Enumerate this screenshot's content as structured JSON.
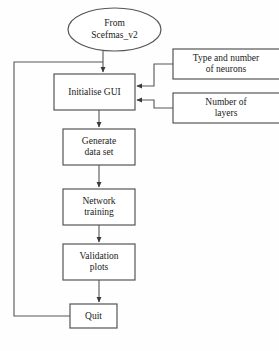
{
  "diagram": {
    "type": "flowchart",
    "background_color": "#fefefe",
    "stroke_color": "#555555",
    "text_color": "#1a1a1a",
    "nodes": [
      {
        "id": "start",
        "shape": "ellipse",
        "label": "From\nScefmas_v2",
        "x": 68,
        "y": 8,
        "width": 93,
        "height": 43
      },
      {
        "id": "initialise-gui",
        "shape": "rect",
        "label": "Initialise GUI",
        "x": 54,
        "y": 74,
        "width": 81,
        "height": 36
      },
      {
        "id": "type-and-number-of-neurons",
        "shape": "rect",
        "label": "Type and number\nof neurons",
        "x": 173,
        "y": 49,
        "width": 110,
        "height": 30
      },
      {
        "id": "number-of-layers",
        "shape": "rect",
        "label": "Number of\nlayers",
        "x": 173,
        "y": 93,
        "width": 110,
        "height": 30
      },
      {
        "id": "generate-data-set",
        "shape": "rect",
        "label": "Generate\ndata set",
        "x": 63,
        "y": 129,
        "width": 72,
        "height": 36
      },
      {
        "id": "network-training",
        "shape": "rect",
        "label": "Network\ntraining",
        "x": 63,
        "y": 189,
        "width": 72,
        "height": 36
      },
      {
        "id": "validation-plots",
        "shape": "rect",
        "label": "Validation\nplots",
        "x": 63,
        "y": 244,
        "width": 72,
        "height": 36
      },
      {
        "id": "quit",
        "shape": "rect",
        "label": "Quit",
        "x": 70,
        "y": 304,
        "width": 47,
        "height": 24
      }
    ],
    "edges": [
      {
        "id": "start-to-initialise",
        "from": "start",
        "to": "initialise-gui",
        "arrow": true
      },
      {
        "id": "neurons-to-initialise",
        "from": "type-and-number-of-neurons",
        "to": "initialise-gui",
        "arrow": true
      },
      {
        "id": "layers-to-initialise",
        "from": "number-of-layers",
        "to": "initialise-gui",
        "arrow": true
      },
      {
        "id": "initialise-to-generate",
        "from": "initialise-gui",
        "to": "generate-data-set",
        "arrow": true
      },
      {
        "id": "generate-to-training",
        "from": "generate-data-set",
        "to": "network-training",
        "arrow": true
      },
      {
        "id": "training-to-validation",
        "from": "network-training",
        "to": "validation-plots",
        "arrow": true
      },
      {
        "id": "validation-to-quit",
        "from": "validation-plots",
        "to": "quit",
        "arrow": true
      },
      {
        "id": "quit-feedback-to-initialise",
        "from": "quit",
        "to": "initialise-gui",
        "arrow": false,
        "style": "loop-left"
      }
    ]
  }
}
